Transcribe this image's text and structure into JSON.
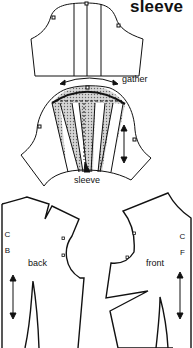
{
  "title": "sleeve",
  "labels": {
    "gather": "gather",
    "sleeve": "sleeve",
    "back": "back",
    "front": "front",
    "center_back": "C B",
    "center_front": "C F"
  },
  "colors": {
    "line": "#111111",
    "shading": "#b8b8b8",
    "background": "#ffffff"
  },
  "pieces": [
    "original-sleeve-slashed",
    "spread-sleeve-with-gather",
    "back-bodice",
    "front-bodice"
  ]
}
